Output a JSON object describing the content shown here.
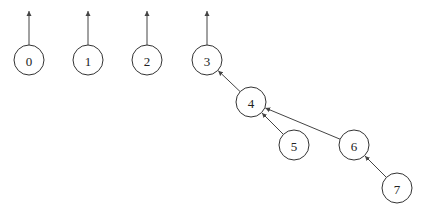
{
  "diagram": {
    "type": "disjoint-set-forest",
    "radius": 15,
    "nodes": [
      {
        "id": "0",
        "label": "0",
        "x": 29,
        "y": 60
      },
      {
        "id": "1",
        "label": "1",
        "x": 88,
        "y": 60
      },
      {
        "id": "2",
        "label": "2",
        "x": 147,
        "y": 60
      },
      {
        "id": "3",
        "label": "3",
        "x": 207,
        "y": 60
      },
      {
        "id": "4",
        "label": "4",
        "x": 251,
        "y": 102
      },
      {
        "id": "5",
        "label": "5",
        "x": 294,
        "y": 145
      },
      {
        "id": "6",
        "label": "6",
        "x": 354,
        "y": 145
      },
      {
        "id": "7",
        "label": "7",
        "x": 397,
        "y": 188
      }
    ],
    "root_arrows": [
      "0",
      "1",
      "2",
      "3"
    ],
    "edges": [
      {
        "from": "4",
        "to": "3"
      },
      {
        "from": "5",
        "to": "4"
      },
      {
        "from": "6",
        "to": "4"
      },
      {
        "from": "7",
        "to": "6"
      }
    ]
  }
}
